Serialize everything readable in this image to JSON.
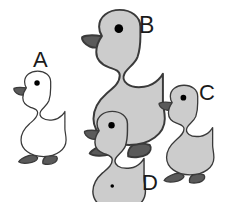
{
  "scene": {
    "width": 231,
    "height": 202,
    "background_color": "#ffffff",
    "description": "Four cartoon ducks of different sizes labelled A, B, C and D"
  },
  "style": {
    "outline_color": "#3a3a3a",
    "eye_color": "#000000",
    "beak_color": "#5a5a5a",
    "foot_color": "#5a5a5a",
    "gray_body_color": "#cccccc",
    "white_body_color": "#ffffff",
    "label_color": "#1a1a1a"
  },
  "ducks": [
    {
      "id": "duck-a",
      "label": "A",
      "body_color": "#ffffff",
      "beak_color": "#5a5a5a",
      "foot_color": "#5a5a5a",
      "eye_color": "#000000",
      "size_rank": "small",
      "scale": 0.6,
      "x": 10,
      "y": 70,
      "has_body_dot": false,
      "label_x": 33,
      "label_y": 49,
      "label_size": 22
    },
    {
      "id": "duck-b",
      "label": "B",
      "body_color": "#cccccc",
      "beak_color": "#5a5a5a",
      "foot_color": "#5a5a5a",
      "eye_color": "#000000",
      "size_rank": "largest",
      "scale": 0.95,
      "x": 76,
      "y": 8,
      "has_body_dot": false,
      "label_x": 139,
      "label_y": 14,
      "label_size": 23
    },
    {
      "id": "duck-c",
      "label": "C",
      "body_color": "#cccccc",
      "beak_color": "#5a5a5a",
      "foot_color": "#5a5a5a",
      "eye_color": "#000000",
      "size_rank": "small-medium",
      "scale": 0.63,
      "x": 155,
      "y": 84,
      "has_body_dot": false,
      "label_x": 199,
      "label_y": 82,
      "label_size": 22
    },
    {
      "id": "duck-d",
      "label": "D",
      "body_color": "#cccccc",
      "beak_color": "#5a5a5a",
      "foot_color": "#5a5a5a",
      "eye_color": "#000000",
      "size_rank": "medium-small",
      "scale": 0.7,
      "x": 80,
      "y": 110,
      "has_body_dot": true,
      "label_x": 142,
      "label_y": 172,
      "label_size": 22
    }
  ]
}
